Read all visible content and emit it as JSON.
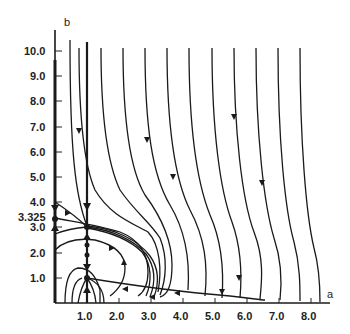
{
  "diagram": {
    "type": "phase-portrait",
    "x_axis": {
      "label": "a",
      "ticks": [
        "1.0",
        "2.0",
        "3.0",
        "4.0",
        "5.0",
        "6.0",
        "7.0",
        "8.0"
      ]
    },
    "y_axis": {
      "label": "b",
      "ticks": [
        "1.0",
        "2.0",
        "3.0",
        "3.325",
        "4.0",
        "5.0",
        "6.0",
        "7.0",
        "8.0",
        "9.0",
        "10.0"
      ]
    },
    "fixed_points": [
      {
        "a": 0,
        "b": 3.325
      },
      {
        "a": 1.0,
        "b": 3.0
      },
      {
        "a": 1.0,
        "b": 1.0
      }
    ],
    "colors": {
      "line": "#1a1a1a",
      "background": "#ffffff"
    }
  }
}
